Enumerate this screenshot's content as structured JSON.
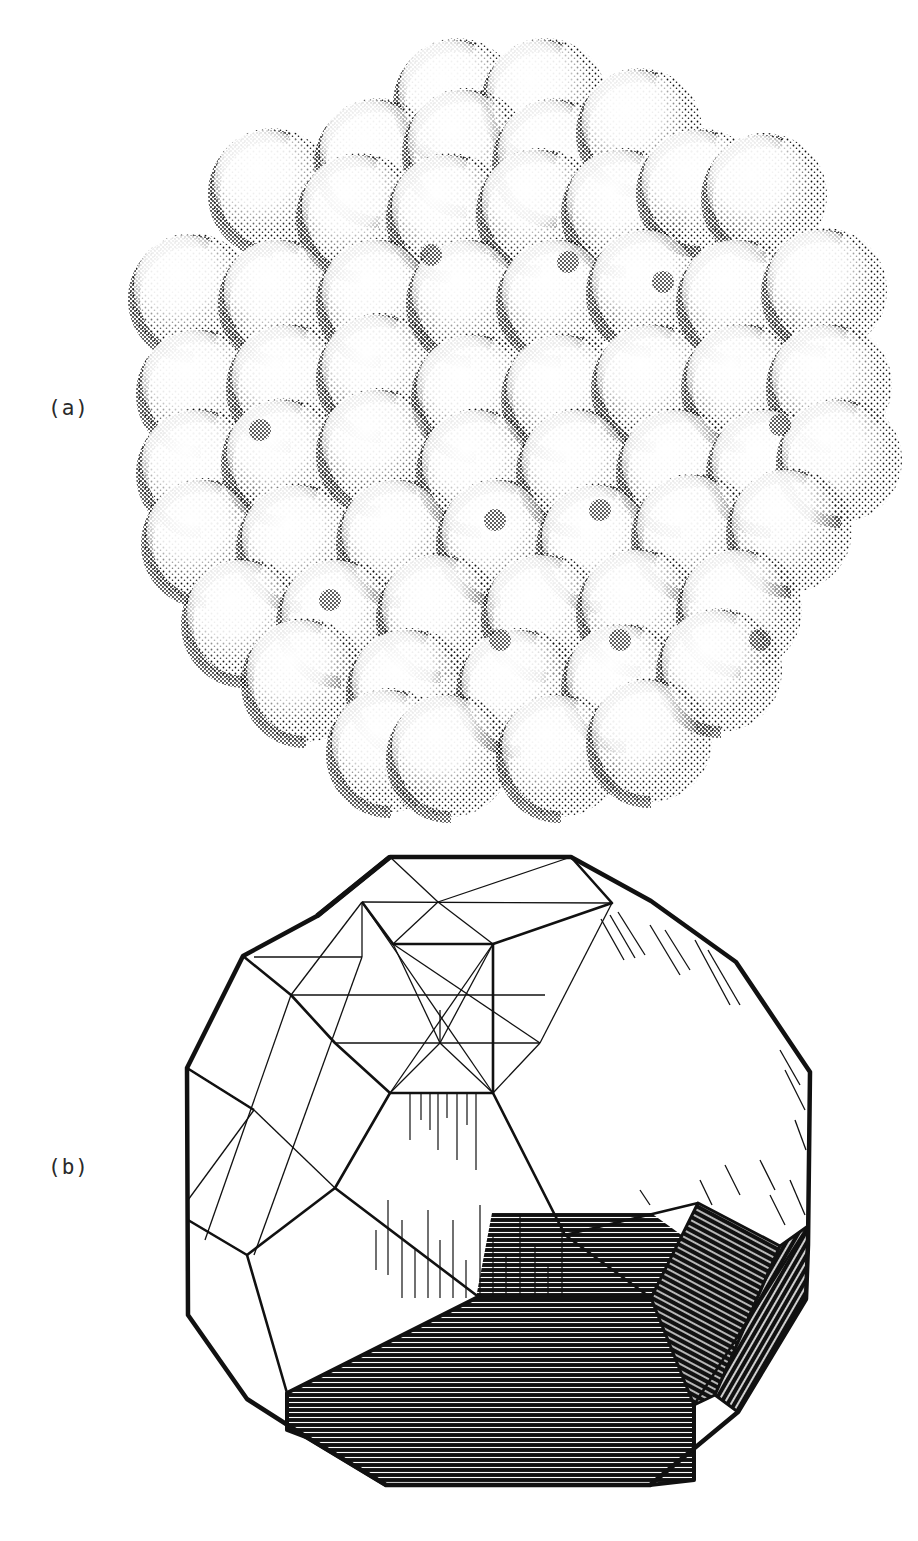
{
  "figure": {
    "panels": [
      {
        "id": "a",
        "label": "(a)",
        "description": "Stippled drawing of a cluster of close-packed spheres forming a roughly spherical/polyhedral aggregate"
      },
      {
        "id": "b",
        "label": "(b)",
        "description": "Line drawing of a faceted polyhedron (truncated polyhedral shape) with shaded facets and inscribed octahedral/cubic construction lines"
      }
    ]
  },
  "colors": {
    "ink": "#111111",
    "paper": "#ffffff",
    "label": "#2a2a2a"
  }
}
